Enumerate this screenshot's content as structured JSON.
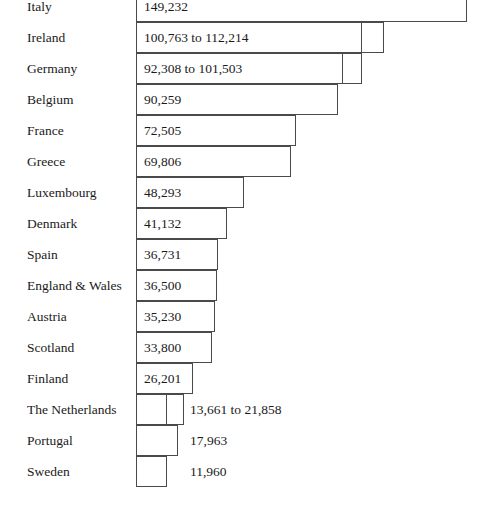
{
  "chart_data": {
    "type": "bar",
    "orientation": "horizontal",
    "title": "",
    "subtitle": "",
    "xlabel": "",
    "ylabel": "",
    "grid": false,
    "legend": null,
    "axis_visible": false,
    "tick_labels": [],
    "xlim": [
      0,
      149232
    ],
    "categories": [
      "Italy",
      "Ireland",
      "Germany",
      "Belgium",
      "France",
      "Greece",
      "Luxembourg",
      "Denmark",
      "Spain",
      "England & Wales",
      "Austria",
      "Scotland",
      "Finland",
      "The Netherlands",
      "Portugal",
      "Sweden"
    ],
    "values": [
      149232,
      112214,
      101503,
      90259,
      72505,
      69806,
      48293,
      41132,
      36731,
      36500,
      35230,
      33800,
      26201,
      21858,
      17963,
      11960
    ],
    "value_labels": [
      "149,232",
      "100,763 to 112,214",
      "92,308 to 101,503",
      "90,259",
      "72,505",
      "69,806",
      "48,293",
      "41,132",
      "36,731",
      "36,500",
      "35,230",
      "33,800",
      "26,201",
      "13,661 to 21,858",
      "17,963",
      "11,960"
    ],
    "rows": [
      {
        "label": "Italy",
        "value_label": "149,232",
        "value": 149232,
        "range_low": null,
        "range_high": null,
        "label_position": "inside",
        "bar_left_px": 136,
        "bar_right_px": 467,
        "split_px": null,
        "row_top_px": 22
      },
      {
        "label": "Ireland",
        "value_label": "100,763 to 112,214",
        "value": 112214,
        "range_low": 100763,
        "range_high": 112214,
        "label_position": "inside",
        "bar_left_px": 136,
        "bar_right_px": 384,
        "split_px": 361,
        "row_top_px": 53
      },
      {
        "label": "Germany",
        "value_label": "92,308 to 101,503",
        "value": 101503,
        "range_low": 92308,
        "range_high": 101503,
        "label_position": "inside",
        "bar_left_px": 136,
        "bar_right_px": 362,
        "split_px": 342,
        "row_top_px": 84
      },
      {
        "label": "Belgium",
        "value_label": "90,259",
        "value": 90259,
        "range_low": null,
        "range_high": null,
        "label_position": "inside",
        "bar_left_px": 136,
        "bar_right_px": 338,
        "split_px": null,
        "row_top_px": 115
      },
      {
        "label": "France",
        "value_label": "72,505",
        "value": 72505,
        "range_low": null,
        "range_high": null,
        "label_position": "inside",
        "bar_left_px": 136,
        "bar_right_px": 296,
        "split_px": null,
        "row_top_px": 146
      },
      {
        "label": "Greece",
        "value_label": "69,806",
        "value": 69806,
        "range_low": null,
        "range_high": null,
        "label_position": "inside",
        "bar_left_px": 136,
        "bar_right_px": 291,
        "split_px": null,
        "row_top_px": 177
      },
      {
        "label": "Luxembourg",
        "value_label": "48,293",
        "value": 48293,
        "range_low": null,
        "range_high": null,
        "label_position": "inside",
        "bar_left_px": 136,
        "bar_right_px": 244,
        "split_px": null,
        "row_top_px": 208
      },
      {
        "label": "Denmark",
        "value_label": "41,132",
        "value": 41132,
        "range_low": null,
        "range_high": null,
        "label_position": "inside",
        "bar_left_px": 136,
        "bar_right_px": 227,
        "split_px": null,
        "row_top_px": 239
      },
      {
        "label": "Spain",
        "value_label": "36,731",
        "value": 36731,
        "range_low": null,
        "range_high": null,
        "label_position": "inside",
        "bar_left_px": 136,
        "bar_right_px": 218,
        "split_px": null,
        "row_top_px": 270
      },
      {
        "label": "England & Wales",
        "value_label": "36,500",
        "value": 36500,
        "range_low": null,
        "range_high": null,
        "label_position": "inside",
        "bar_left_px": 136,
        "bar_right_px": 217,
        "split_px": null,
        "row_top_px": 301
      },
      {
        "label": "Austria",
        "value_label": "35,230",
        "value": 35230,
        "range_low": null,
        "range_high": null,
        "label_position": "inside",
        "bar_left_px": 136,
        "bar_right_px": 215,
        "split_px": null,
        "row_top_px": 332
      },
      {
        "label": "Scotland",
        "value_label": "33,800",
        "value": 33800,
        "range_low": null,
        "range_high": null,
        "label_position": "inside",
        "bar_left_px": 136,
        "bar_right_px": 212,
        "split_px": null,
        "row_top_px": 363
      },
      {
        "label": "Finland",
        "value_label": "26,201",
        "value": 26201,
        "range_low": null,
        "range_high": null,
        "label_position": "inside",
        "bar_left_px": 136,
        "bar_right_px": 193,
        "split_px": null,
        "row_top_px": 394
      },
      {
        "label": "The Netherlands",
        "value_label": "13,661 to 21,858",
        "value": 21858,
        "range_low": 13661,
        "range_high": 21858,
        "label_position": "outside",
        "bar_left_px": 136,
        "bar_right_px": 184,
        "split_px": 166,
        "row_top_px": 425
      },
      {
        "label": "Portugal",
        "value_label": "17,963",
        "value": 17963,
        "range_low": null,
        "range_high": null,
        "label_position": "outside",
        "bar_left_px": 136,
        "bar_right_px": 178,
        "split_px": null,
        "row_top_px": 456
      },
      {
        "label": "Sweden",
        "value_label": "11,960",
        "value": 11960,
        "range_low": null,
        "range_high": null,
        "label_position": "outside",
        "bar_left_px": 136,
        "bar_right_px": 167,
        "split_px": null,
        "row_top_px": 487
      }
    ]
  },
  "style": {
    "background": "#ffffff",
    "bar_fill": "#ffffff",
    "bar_stroke": "#4a4a4a",
    "text_color": "#1a1a1a"
  }
}
